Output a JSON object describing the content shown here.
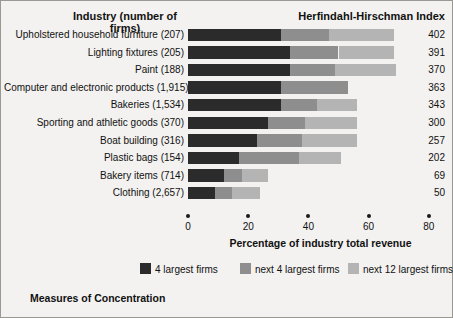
{
  "header": {
    "industry_label": "Industry (number of firms)",
    "hhi_label": "Herfindahl-Hirschman Index"
  },
  "caption": "Measures of Concentration",
  "colors": {
    "background": "#f3f2f0",
    "border": "#9a9894",
    "four_largest": "#2b2b2b",
    "next_four": "#8e8e8e",
    "next_twelve": "#b4b4b4",
    "text": "#111111"
  },
  "chart_data": {
    "type": "bar",
    "orientation": "horizontal",
    "stacked": true,
    "title": "Measures of Concentration",
    "xlabel": "Percentage of industry total revenue",
    "ylabel": "Industry (number of firms)",
    "xlim": [
      0,
      80
    ],
    "xticks": [
      0,
      20,
      40,
      60,
      80
    ],
    "xtick_labels": [
      "0",
      "20",
      "40",
      "60",
      "80"
    ],
    "grid": false,
    "legend_position": "bottom",
    "legend": [
      "4 largest firms",
      "next 4 largest firms",
      "next 12 largest firms"
    ],
    "series": [
      {
        "name": "4 largest firms",
        "values": [
          31,
          34,
          34,
          31,
          31,
          26.5,
          23,
          17,
          12,
          9
        ]
      },
      {
        "name": "next 4 largest firms",
        "values": [
          16,
          16,
          15,
          22,
          12,
          12.5,
          15,
          20,
          6,
          5.5
        ]
      },
      {
        "name": "next 12 largest firms",
        "values": [
          21.5,
          18.5,
          20,
          0,
          13,
          17,
          18,
          14,
          8.5,
          9.5
        ]
      }
    ],
    "categories": [
      "Upholstered household furniture (207)",
      "Lighting fixtures (205)",
      "Paint (188)",
      "Computer and electronic products (1,915)",
      "Bakeries (1,534)",
      "Sporting and athletic goods (370)",
      "Boat building (316)",
      "Plastic bags (154)",
      "Bakery items (714)",
      "Clothing (2,657)"
    ],
    "secondary_axis": {
      "name": "Herfindahl-Hirschman Index",
      "values": [
        402,
        391,
        370,
        363,
        343,
        300,
        257,
        202,
        69,
        50
      ]
    }
  }
}
